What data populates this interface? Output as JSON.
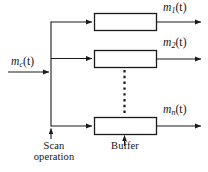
{
  "figure": {
    "type": "block-diagram",
    "background_color": "#ffffff",
    "line_color": "#1a1a1a",
    "box_fill": "#ffffff"
  },
  "input": {
    "label_main": "m",
    "label_sub": "c",
    "label_arg": "(t)",
    "label_full": "m_c(t)",
    "name": "input-signal"
  },
  "outputs": [
    {
      "label_main": "m",
      "label_sub": "1",
      "label_arg": "(t)",
      "label_full": "m_1(t)",
      "name": "output-signal-1"
    },
    {
      "label_main": "m",
      "label_sub": "2",
      "label_arg": "(t)",
      "label_full": "m_2(t)",
      "name": "output-signal-2"
    },
    {
      "label_main": "m",
      "label_sub": "n",
      "label_arg": "(t)",
      "label_full": "m_n(t)",
      "name": "output-signal-n"
    }
  ],
  "blocks": [
    {
      "name": "buffer-block-1",
      "label": ""
    },
    {
      "name": "buffer-block-2",
      "label": ""
    },
    {
      "name": "buffer-block-n",
      "label": ""
    }
  ],
  "annotations": {
    "scan": {
      "line1": "Scan",
      "line2": "operation",
      "full": "Scan operation"
    },
    "buffer": {
      "line1": "Buffer",
      "line2": "",
      "full": "Buffer"
    }
  },
  "ellipsis": {
    "orientation": "vertical",
    "style": "dotted",
    "meaning": "additional channels omitted"
  }
}
